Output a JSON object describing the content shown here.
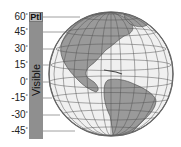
{
  "figure": {
    "type": "latitude visibility diagram with globe",
    "bar": {
      "top_label": "Ptl",
      "label": "Visible",
      "color": "#8f8f8f"
    },
    "latitude_ticks": [
      {
        "label": "60",
        "y": 17
      },
      {
        "label": "45",
        "y": 32
      },
      {
        "label": "30",
        "y": 49
      },
      {
        "label": "15",
        "y": 65
      },
      {
        "label": "0",
        "y": 82
      },
      {
        "label": "-15",
        "y": 98
      },
      {
        "label": "-30",
        "y": 115
      },
      {
        "label": "-45",
        "y": 131
      }
    ],
    "degree_symbol": "°",
    "globe": {
      "view": "Western Hemisphere (Americas)",
      "ocean_color": "#f0f0f0",
      "land_color": "#9a9a9a",
      "grid_color": "#555555"
    }
  }
}
